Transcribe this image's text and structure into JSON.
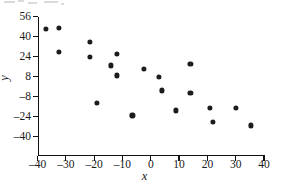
{
  "figure": {
    "type": "scatter-plot",
    "background": "#ffffff",
    "point_color": "#1c1c1c",
    "axis_color": "#111111"
  },
  "axes": {
    "x": {
      "label": "x",
      "min": -40,
      "max": 40,
      "ticks": [
        -40,
        -30,
        -20,
        -10,
        0,
        10,
        20,
        30,
        40
      ],
      "tick_labels": [
        "–40",
        "–30",
        "–20",
        "–10",
        "0",
        "10",
        "20",
        "30",
        "40"
      ]
    },
    "y": {
      "label": "y",
      "min": -40,
      "max": 56,
      "ticks": [
        56,
        40,
        24,
        8,
        -8,
        -24,
        -40
      ],
      "tick_labels": [
        "56",
        "40",
        "24",
        "8",
        "–8",
        "–24",
        "–40"
      ]
    }
  },
  "chart_data": {
    "type": "scatter",
    "title": "",
    "xlabel": "x",
    "ylabel": "y",
    "xlim": [
      -40,
      40
    ],
    "ylim": [
      -40,
      56
    ],
    "xticks": [
      -40,
      -30,
      -20,
      -10,
      0,
      10,
      20,
      30,
      40
    ],
    "yticks": [
      56,
      40,
      24,
      8,
      -8,
      -24,
      -40
    ],
    "grid": false,
    "legend": false,
    "marker": "filled-circle",
    "series": [
      {
        "name": "observations",
        "points": [
          {
            "x": -37.0,
            "y": 46.0
          },
          {
            "x": -32.5,
            "y": 47.0
          },
          {
            "x": -32.5,
            "y": 28.0
          },
          {
            "x": -21.5,
            "y": 36.0
          },
          {
            "x": -21.5,
            "y": 24.0
          },
          {
            "x": -19.0,
            "y": -13.0
          },
          {
            "x": -14.0,
            "y": 17.0
          },
          {
            "x": -12.0,
            "y": 26.0
          },
          {
            "x": -12.0,
            "y": 9.0
          },
          {
            "x": -6.5,
            "y": -23.0
          },
          {
            "x": -2.5,
            "y": 14.0
          },
          {
            "x": 3.0,
            "y": 8.0
          },
          {
            "x": 4.0,
            "y": -3.0
          },
          {
            "x": 9.0,
            "y": -19.0
          },
          {
            "x": 14.0,
            "y": 18.0
          },
          {
            "x": 14.0,
            "y": -5.0
          },
          {
            "x": 21.0,
            "y": -17.0
          },
          {
            "x": 22.0,
            "y": -28.0
          },
          {
            "x": 30.0,
            "y": -17.0
          },
          {
            "x": 35.5,
            "y": -31.0
          }
        ]
      }
    ]
  }
}
